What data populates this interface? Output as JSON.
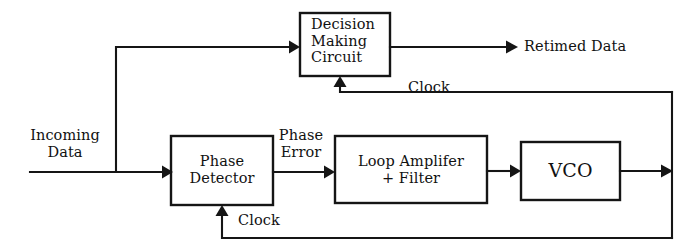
{
  "diagram": {
    "ink_color": "#151515",
    "background_color": "#ffffff",
    "blocks": [
      {
        "id": "decision-making-circuit",
        "label": "Decision\nMaking\nCircuit",
        "line1": "Decision",
        "line2": "Making",
        "line3": "Circuit"
      },
      {
        "id": "phase-detector",
        "label": "Phase\nDetector",
        "line1": "Phase",
        "line2": "Detector"
      },
      {
        "id": "loop-amplifier-filter",
        "label": "Loop Amplifer\n+ Filter",
        "line1": "Loop Amplifer",
        "line2": "+ Filter"
      },
      {
        "id": "vco",
        "label": "VCO"
      }
    ],
    "signal_labels": {
      "incoming_data_line1": "Incoming",
      "incoming_data_line2": "Data",
      "retimed_data": "Retimed Data",
      "phase_error_line1": "Phase",
      "phase_error_line2": "Error",
      "clock_top": "Clock",
      "clock_bottom": "Clock"
    }
  }
}
